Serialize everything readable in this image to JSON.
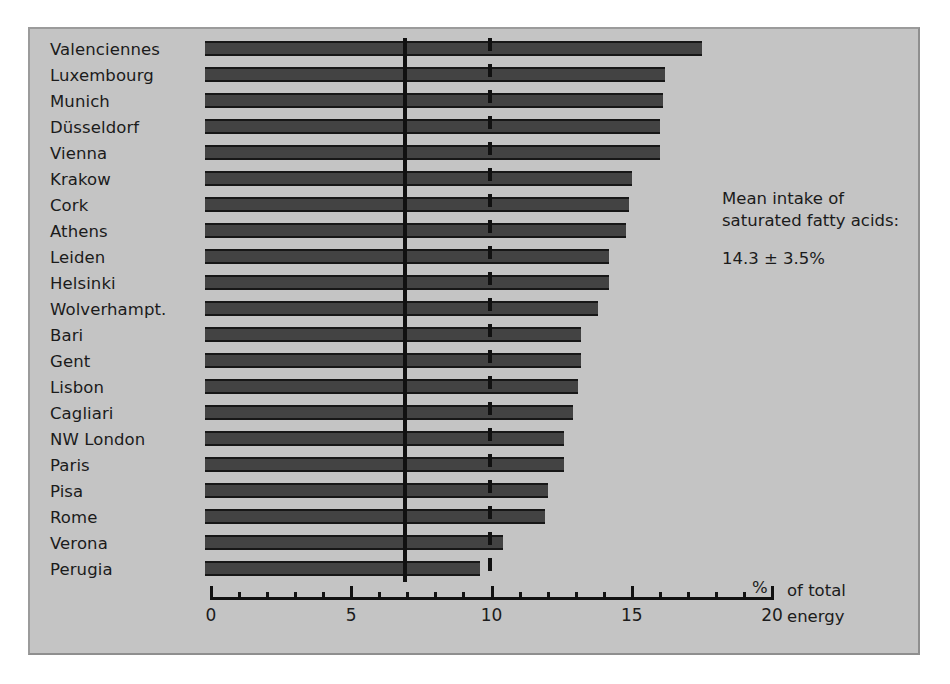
{
  "chart_data": {
    "type": "bar",
    "orientation": "horizontal",
    "title": "",
    "xlabel": "% of total energy",
    "ylabel": "",
    "xlim": [
      0,
      20
    ],
    "grid": false,
    "legend": null,
    "xticks_major": [
      0,
      5,
      10,
      15,
      20
    ],
    "xtick_labels": [
      "0",
      "5",
      "10",
      "15",
      "20"
    ],
    "xticks_minor": [
      1,
      2,
      3,
      4,
      6,
      7,
      8,
      9,
      11,
      12,
      13,
      14,
      16,
      17,
      18,
      19
    ],
    "categories": [
      "Valenciennes",
      "Luxembourg",
      "Munich",
      "Düsseldorf",
      "Vienna",
      "Krakow",
      "Cork",
      "Athens",
      "Leiden",
      "Helsinki",
      "Wolverhampt.",
      "Bari",
      "Gent",
      "Lisbon",
      "Cagliari",
      "NW London",
      "Paris",
      "Pisa",
      "Rome",
      "Verona",
      "Perugia"
    ],
    "values": [
      17.5,
      16.2,
      16.1,
      16.0,
      16.0,
      15.0,
      14.9,
      14.8,
      14.2,
      14.2,
      13.8,
      13.2,
      13.2,
      13.1,
      12.9,
      12.6,
      12.6,
      12.0,
      11.9,
      10.4,
      9.6
    ],
    "reference_lines": [
      {
        "name": "solid-reference-line",
        "value": 6.9,
        "style": "solid"
      },
      {
        "name": "dashed-reference-line",
        "value": 9.95,
        "style": "dashed"
      }
    ],
    "annotation": {
      "line1": "Mean intake of",
      "line2": "saturated fatty acids:",
      "value": "14.3 ± 3.5%"
    },
    "axis_caption": {
      "percent": "%",
      "line1": "of total",
      "line2": "energy"
    },
    "colors": {
      "panel_background": "#c4c4c4",
      "bar_fill": "#434343",
      "bar_edge": "#171717",
      "axis": "#111111",
      "text": "#1b1b1b",
      "page_background": "#ffffff"
    }
  }
}
